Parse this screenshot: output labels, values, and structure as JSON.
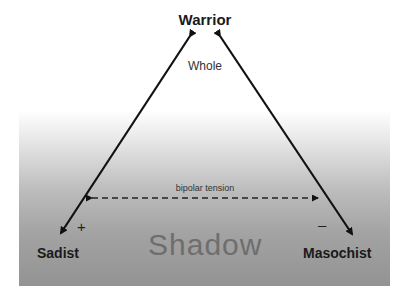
{
  "diagram": {
    "apex": {
      "label": "Warrior",
      "sublabel": "Whole"
    },
    "left_pole": {
      "label": "Sadist",
      "sign": "+"
    },
    "right_pole": {
      "label": "Masochist",
      "sign": "–"
    },
    "shadow_label": "Shadow",
    "tension_label": "bipolar tension",
    "colors": {
      "arrow": "#111111",
      "shadow_gradient_top": "#ffffff",
      "shadow_gradient_bottom": "#939393",
      "shadow_text": "#6e6e6e"
    }
  }
}
